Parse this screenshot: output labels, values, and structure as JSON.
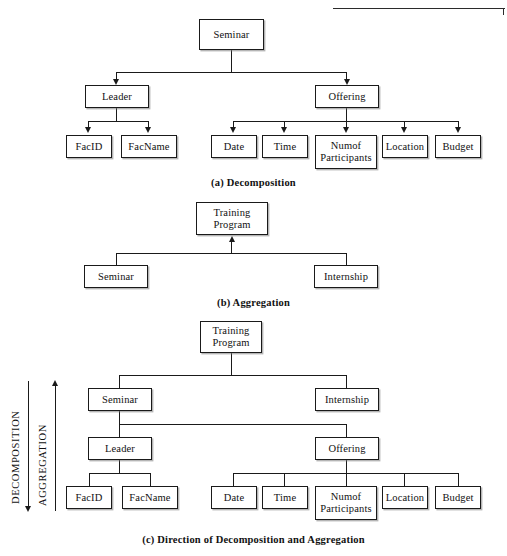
{
  "figure": {
    "panels": [
      {
        "id": "a",
        "caption": "(a) Decomposition",
        "root": "Seminar",
        "nodes": {
          "seminar": "Seminar",
          "leader": "Leader",
          "offering": "Offering",
          "facid": "FacID",
          "facname": "FacName",
          "date": "Date",
          "time": "Time",
          "numof_participants_line1": "Numof",
          "numof_participants_line2": "Participants",
          "location": "Location",
          "budget": "Budget"
        },
        "arrow_direction": "down"
      },
      {
        "id": "b",
        "caption": "(b) Aggregation",
        "nodes": {
          "training_line1": "Training",
          "training_line2": "Program",
          "seminar": "Seminar",
          "internship": "Internship"
        },
        "arrow_direction": "up"
      },
      {
        "id": "c",
        "caption": "(c) Direction of Decomposition and Aggregation",
        "nodes": {
          "training_line1": "Training",
          "training_line2": "Program",
          "seminar": "Seminar",
          "internship": "Internship",
          "leader": "Leader",
          "offering": "Offering",
          "facid": "FacID",
          "facname": "FacName",
          "date": "Date",
          "time": "Time",
          "numof_participants_line1": "Numof",
          "numof_participants_line2": "Participants",
          "location": "Location",
          "budget": "Budget"
        },
        "direction_labels": {
          "decomposition": "DECOMPOSITION",
          "aggregation": "AGGREGATION"
        }
      }
    ]
  },
  "colors": {
    "ink": "#1a1a1a",
    "paper": "#ffffff",
    "shadow": "#787878"
  }
}
